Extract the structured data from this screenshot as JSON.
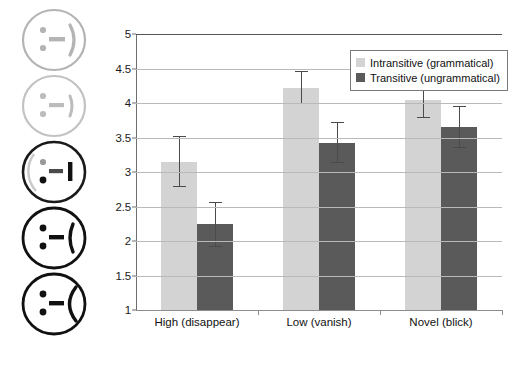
{
  "chart_data": {
    "type": "bar",
    "title": "",
    "xlabel": "",
    "ylabel": "",
    "ylim": [
      1,
      5
    ],
    "ytick_labels": [
      "5",
      "4.5",
      "4",
      "3.5",
      "3",
      "2.5",
      "2",
      "1.5",
      "1"
    ],
    "ytick_values": [
      5,
      4.5,
      4,
      3.5,
      3,
      2.5,
      2,
      1.5,
      1
    ],
    "grid": true,
    "legend_position": "top-right",
    "categories": [
      "High (disappear)",
      "Low (vanish)",
      "Novel (blick)"
    ],
    "series": [
      {
        "name": "Intransitive (grammatical)",
        "color": "#d3d3d3",
        "values": [
          3.15,
          4.22,
          4.04
        ],
        "error_upper": [
          3.52,
          4.46,
          4.3
        ],
        "error_lower": [
          2.78,
          3.98,
          3.78
        ]
      },
      {
        "name": "Transitive (ungrammatical)",
        "color": "#5a5a5a",
        "values": [
          2.24,
          3.42,
          3.65
        ],
        "error_upper": [
          2.56,
          3.72,
          3.95
        ],
        "error_lower": [
          1.92,
          3.13,
          3.35
        ]
      }
    ]
  },
  "legend": {
    "items": [
      {
        "label": "Intransitive (grammatical)",
        "swatch": "light"
      },
      {
        "label": "Transitive (ungrammatical)",
        "swatch": "dark"
      }
    ]
  },
  "faces": {
    "items": [
      {
        "name": "smiley-face-very-happy",
        "mood": "very-happy",
        "stroke": "#b3b3b3"
      },
      {
        "name": "smiley-face-happy",
        "mood": "happy",
        "stroke": "#b3b3b3"
      },
      {
        "name": "smiley-face-neutral",
        "mood": "neutral",
        "stroke": "#1a1a1a"
      },
      {
        "name": "smiley-face-sad",
        "mood": "sad",
        "stroke": "#1a1a1a"
      },
      {
        "name": "smiley-face-very-sad",
        "mood": "very-sad",
        "stroke": "#1a1a1a"
      }
    ]
  },
  "colors": {
    "series_light": "#d3d3d3",
    "series_dark": "#5a5a5a",
    "gridline": "#b9b9b9",
    "axis": "#6e6e6e"
  }
}
